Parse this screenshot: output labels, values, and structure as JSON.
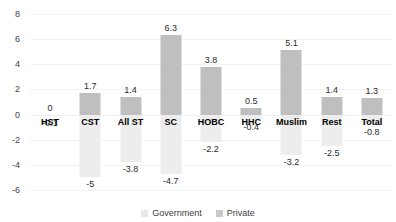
{
  "chart_data": {
    "type": "bar",
    "title": "",
    "subtitle": "",
    "xlabel": "",
    "ylabel": "",
    "ylim": [
      -6,
      8
    ],
    "yticks": [
      8,
      6,
      4,
      2,
      0,
      -2,
      -4,
      -6
    ],
    "grid": true,
    "legend_position": "bottom",
    "categories": [
      "HST",
      "CST",
      "All ST",
      "SC",
      "HOBC",
      "HHC",
      "Muslim",
      "Rest",
      "Total"
    ],
    "series": [
      {
        "name": "Government",
        "color": "#bfbfbf",
        "values": [
          0,
          1.7,
          1.4,
          6.3,
          3.8,
          0.5,
          5.1,
          1.4,
          1.3
        ],
        "labels": [
          "0",
          "1.7",
          "1.4",
          "6.3",
          "3.8",
          "0.5",
          "5.1",
          "1.4",
          "1.3"
        ]
      },
      {
        "name": "Private",
        "color": "#ededed",
        "values": [
          -0.1,
          -5,
          -3.8,
          -4.7,
          -2.2,
          -0.4,
          -3.2,
          -2.5,
          -0.8
        ],
        "labels": [
          "-0.1",
          "-5",
          "-3.8",
          "-4.7",
          "-2.2",
          "-0.4",
          "-3.2",
          "-2.5",
          "-0.8"
        ]
      }
    ]
  },
  "axis": {
    "ytick_labels": [
      "8",
      "6",
      "4",
      "2",
      "0",
      "-2",
      "-4",
      "-6"
    ]
  },
  "legend": {
    "items": [
      {
        "label": "Government",
        "color": "#bfbfbf"
      },
      {
        "label": "Private",
        "color": "#ededed"
      }
    ]
  }
}
